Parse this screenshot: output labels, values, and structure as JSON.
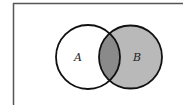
{
  "diagram": {
    "type": "venn",
    "frame": {
      "stroke": "#555555"
    },
    "sets": [
      {
        "id": "A",
        "label": "A",
        "fill": "#ffffff",
        "stroke": "#111111"
      },
      {
        "id": "B",
        "label": "B",
        "fill": "#b9b9b9",
        "stroke": "#111111"
      }
    ],
    "intersection": {
      "label": "",
      "fill": "#8a8a8a"
    },
    "shaded_region": "B"
  }
}
